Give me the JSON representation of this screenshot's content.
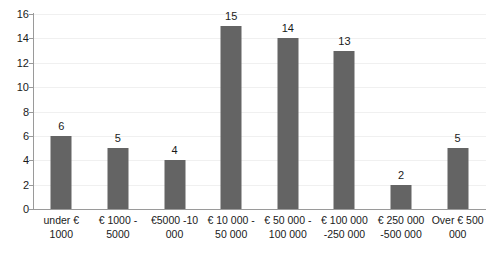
{
  "chart_data": {
    "type": "bar",
    "title": "",
    "subtitle": "",
    "xlabel": "",
    "ylabel": "",
    "ylim": [
      0,
      16
    ],
    "ytick_step": 2,
    "yticks": [
      16,
      14,
      12,
      10,
      8,
      6,
      4,
      2,
      0
    ],
    "grid": true,
    "legend": false,
    "bar_color": "#646464",
    "categories": [
      "under € 1000",
      "€ 1000 - 5000",
      "€5000 -10 000",
      "€ 10 000 - 50 000",
      "€ 50 000 - 100 000",
      "€ 100 000 -250 000",
      "€ 250 000 -500 000",
      "Over € 500 000"
    ],
    "category_lines": [
      [
        "under €",
        "1000"
      ],
      [
        "€ 1000 -",
        "5000"
      ],
      [
        "€5000 -10",
        "000"
      ],
      [
        "€ 10 000 -",
        "50 000"
      ],
      [
        "€ 50 000 -",
        "100 000"
      ],
      [
        "€ 100 000",
        "-250 000"
      ],
      [
        "€ 250 000",
        "-500 000"
      ],
      [
        "Over € 500",
        "000"
      ]
    ],
    "values": [
      6,
      5,
      4,
      15,
      14,
      13,
      2,
      5
    ],
    "data_labels": [
      "6",
      "5",
      "4",
      "15",
      "14",
      "13",
      "2",
      "5"
    ]
  }
}
